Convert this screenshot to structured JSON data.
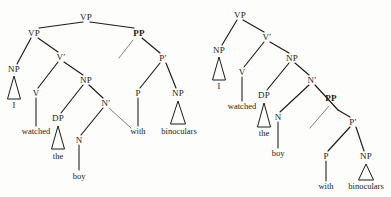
{
  "figure": {
    "kind": "syntax-tree-pair",
    "sentence_words": [
      "I",
      "watched",
      "the",
      "boy",
      "with",
      "binoculars"
    ],
    "ink_color": "#1d1a18",
    "trace_color": "#6e6a66",
    "background_color": "#fdfdfb"
  },
  "trees": [
    {
      "id": "vp-attachment",
      "name": "left-tree",
      "root_label": "VP",
      "highlight_label": "PP",
      "nodes": [
        {
          "id": "L-VP-top",
          "label": "VP",
          "x": 86,
          "y": 17,
          "bold": false,
          "type": "node"
        },
        {
          "id": "L-VP-low",
          "label": "VP",
          "x": 34,
          "y": 33,
          "bold": false,
          "type": "node"
        },
        {
          "id": "L-PP",
          "label": "PP",
          "x": 139,
          "y": 33,
          "bold": true,
          "type": "node"
        },
        {
          "id": "L-NP-subj",
          "label": "NP",
          "x": 14,
          "y": 69,
          "bold": false,
          "type": "node"
        },
        {
          "id": "L-Vbar",
          "label": "V′",
          "x": 61,
          "y": 57,
          "bold": false,
          "type": "node"
        },
        {
          "id": "L-V",
          "label": "V",
          "x": 36,
          "y": 93,
          "bold": false,
          "type": "node"
        },
        {
          "id": "L-NP-obj",
          "label": "NP",
          "x": 86,
          "y": 80,
          "bold": false,
          "type": "node"
        },
        {
          "id": "L-DP",
          "label": "DP",
          "x": 58,
          "y": 118,
          "bold": false,
          "type": "node"
        },
        {
          "id": "L-Nbar",
          "label": "N′",
          "x": 106,
          "y": 103,
          "bold": false,
          "type": "node"
        },
        {
          "id": "L-N",
          "label": "N",
          "x": 79,
          "y": 140,
          "bold": false,
          "type": "node"
        },
        {
          "id": "L-Pbar",
          "label": "P′",
          "x": 163,
          "y": 58,
          "bold": false,
          "type": "node"
        },
        {
          "id": "L-P",
          "label": "P",
          "x": 138,
          "y": 93,
          "bold": false,
          "type": "node"
        },
        {
          "id": "L-NP-pobj",
          "label": "NP",
          "x": 178,
          "y": 93,
          "bold": false,
          "type": "node"
        }
      ],
      "leaves": [
        {
          "id": "L-leaf-I",
          "label": "I",
          "x": 14,
          "y": 105
        },
        {
          "id": "L-leaf-wat",
          "label": "watched",
          "x": 36,
          "y": 131
        },
        {
          "id": "L-leaf-the",
          "label": "the",
          "x": 58,
          "y": 156
        },
        {
          "id": "L-leaf-boy",
          "label": "boy",
          "x": 79,
          "y": 176
        },
        {
          "id": "L-leaf-with",
          "label": "with",
          "x": 138,
          "y": 131
        },
        {
          "id": "L-leaf-bino",
          "label": "binoculars",
          "x": 179,
          "y": 131
        }
      ],
      "branches": [
        {
          "from": "L-VP-top",
          "to": "L-VP-low",
          "x1": 83,
          "y1": 22,
          "x2": 39,
          "y2": 28
        },
        {
          "from": "L-VP-top",
          "to": "L-PP",
          "x1": 90,
          "y1": 22,
          "x2": 134,
          "y2": 28
        },
        {
          "from": "L-VP-low",
          "to": "L-NP-subj",
          "x1": 31,
          "y1": 38,
          "x2": 17,
          "y2": 64
        },
        {
          "from": "L-VP-low",
          "to": "L-Vbar",
          "x1": 38,
          "y1": 38,
          "x2": 58,
          "y2": 52
        },
        {
          "from": "L-Vbar",
          "to": "L-V",
          "x1": 58,
          "y1": 62,
          "x2": 38,
          "y2": 88
        },
        {
          "from": "L-Vbar",
          "to": "L-NP-obj",
          "x1": 64,
          "y1": 62,
          "x2": 83,
          "y2": 75
        },
        {
          "from": "L-NP-obj",
          "to": "L-DP",
          "x1": 83,
          "y1": 85,
          "x2": 61,
          "y2": 113
        },
        {
          "from": "L-NP-obj",
          "to": "L-Nbar",
          "x1": 89,
          "y1": 85,
          "x2": 103,
          "y2": 98
        },
        {
          "from": "L-Nbar",
          "to": "L-N",
          "x1": 103,
          "y1": 108,
          "x2": 81,
          "y2": 135
        },
        {
          "from": "L-PP",
          "to": "L-Pbar",
          "x1": 142,
          "y1": 38,
          "x2": 160,
          "y2": 53
        },
        {
          "from": "L-Pbar",
          "to": "L-P",
          "x1": 160,
          "y1": 63,
          "x2": 140,
          "y2": 88
        },
        {
          "from": "L-Pbar",
          "to": "L-NP-pobj",
          "x1": 166,
          "y1": 63,
          "x2": 176,
          "y2": 88
        }
      ],
      "stems": [
        {
          "from": "L-V",
          "to": "L-leaf-wat",
          "x1": 36,
          "y1": 98,
          "x2": 36,
          "y2": 126
        },
        {
          "from": "L-N",
          "to": "L-leaf-boy",
          "x1": 79,
          "y1": 145,
          "x2": 79,
          "y2": 170
        },
        {
          "from": "L-P",
          "to": "L-leaf-with",
          "x1": 138,
          "y1": 98,
          "x2": 138,
          "y2": 126
        }
      ],
      "triangles": [
        {
          "for": "L-NP-subj",
          "apex_x": 14,
          "apex_y": 76,
          "base_y": 99,
          "half_width": 6.5
        },
        {
          "for": "L-DP",
          "apex_x": 58,
          "apex_y": 126,
          "base_y": 149,
          "half_width": 6.5
        },
        {
          "for": "L-NP-pobj",
          "apex_x": 178,
          "apex_y": 101,
          "base_y": 124,
          "half_width": 7.5
        }
      ],
      "movement_arcs": [
        {
          "label": "pp-trace",
          "x1": 133,
          "y1": 40,
          "x2": 119,
          "y2": 58
        },
        {
          "label": "nbar-trace",
          "x1": 109,
          "y1": 108,
          "x2": 131,
          "y2": 128
        }
      ]
    },
    {
      "id": "np-attachment",
      "name": "right-tree",
      "root_label": "VP",
      "highlight_label": "PP",
      "nodes": [
        {
          "id": "R-VP",
          "label": "VP",
          "x": 240,
          "y": 15,
          "bold": false,
          "type": "node"
        },
        {
          "id": "R-NP-subj",
          "label": "NP",
          "x": 219,
          "y": 50,
          "bold": false,
          "type": "node"
        },
        {
          "id": "R-Vbar",
          "label": "V′",
          "x": 267,
          "y": 37,
          "bold": false,
          "type": "node"
        },
        {
          "id": "R-V",
          "label": "V",
          "x": 242,
          "y": 72,
          "bold": false,
          "type": "node"
        },
        {
          "id": "R-NP-obj",
          "label": "NP",
          "x": 292,
          "y": 58,
          "bold": false,
          "type": "node"
        },
        {
          "id": "R-DP",
          "label": "DP",
          "x": 264,
          "y": 95,
          "bold": false,
          "type": "node"
        },
        {
          "id": "R-Nbar",
          "label": "N′",
          "x": 312,
          "y": 80,
          "bold": false,
          "type": "node"
        },
        {
          "id": "R-N",
          "label": "N",
          "x": 278,
          "y": 117,
          "bold": false,
          "type": "node"
        },
        {
          "id": "R-PP",
          "label": "PP",
          "x": 331,
          "y": 98,
          "bold": true,
          "type": "node"
        },
        {
          "id": "R-Pbar",
          "label": "P′",
          "x": 353,
          "y": 122,
          "bold": false,
          "type": "node"
        },
        {
          "id": "R-P",
          "label": "P",
          "x": 326,
          "y": 156,
          "bold": false,
          "type": "node"
        },
        {
          "id": "R-NP-pobj",
          "label": "NP",
          "x": 366,
          "y": 156,
          "bold": false,
          "type": "node"
        }
      ],
      "leaves": [
        {
          "id": "R-leaf-I",
          "label": "I",
          "x": 219,
          "y": 86
        },
        {
          "id": "R-leaf-wat",
          "label": "watched",
          "x": 242,
          "y": 106
        },
        {
          "id": "R-leaf-the",
          "label": "the",
          "x": 264,
          "y": 133
        },
        {
          "id": "R-leaf-boy",
          "label": "boy",
          "x": 278,
          "y": 153
        },
        {
          "id": "R-leaf-with",
          "label": "with",
          "x": 326,
          "y": 186
        },
        {
          "id": "R-leaf-bino",
          "label": "binoculars",
          "x": 366,
          "y": 186
        }
      ],
      "branches": [
        {
          "from": "R-VP",
          "to": "R-NP-subj",
          "x1": 237,
          "y1": 20,
          "x2": 222,
          "y2": 45
        },
        {
          "from": "R-VP",
          "to": "R-Vbar",
          "x1": 243,
          "y1": 20,
          "x2": 264,
          "y2": 32
        },
        {
          "from": "R-Vbar",
          "to": "R-V",
          "x1": 264,
          "y1": 42,
          "x2": 244,
          "y2": 67
        },
        {
          "from": "R-Vbar",
          "to": "R-NP-obj",
          "x1": 270,
          "y1": 42,
          "x2": 289,
          "y2": 53
        },
        {
          "from": "R-NP-obj",
          "to": "R-DP",
          "x1": 289,
          "y1": 63,
          "x2": 267,
          "y2": 90
        },
        {
          "from": "R-NP-obj",
          "to": "R-Nbar",
          "x1": 295,
          "y1": 63,
          "x2": 309,
          "y2": 75
        },
        {
          "from": "R-Nbar",
          "to": "R-N",
          "x1": 309,
          "y1": 85,
          "x2": 280,
          "y2": 112
        },
        {
          "from": "R-Nbar",
          "to": "R-PP",
          "x1": 315,
          "y1": 85,
          "x2": 338,
          "y2": 110
        },
        {
          "from": "R-PP",
          "to": "R-Pbar",
          "x1": 338,
          "y1": 110,
          "x2": 350,
          "y2": 117
        },
        {
          "from": "R-Pbar",
          "to": "R-P",
          "x1": 350,
          "y1": 127,
          "x2": 328,
          "y2": 151
        },
        {
          "from": "R-Pbar",
          "to": "R-NP-pobj",
          "x1": 356,
          "y1": 127,
          "x2": 364,
          "y2": 151
        }
      ],
      "stems": [
        {
          "from": "R-V",
          "to": "R-leaf-wat",
          "x1": 242,
          "y1": 77,
          "x2": 242,
          "y2": 101
        },
        {
          "from": "R-N",
          "to": "R-leaf-boy",
          "x1": 278,
          "y1": 122,
          "x2": 278,
          "y2": 148
        },
        {
          "from": "R-P",
          "to": "R-leaf-with",
          "x1": 326,
          "y1": 161,
          "x2": 326,
          "y2": 181
        }
      ],
      "triangles": [
        {
          "for": "R-NP-subj",
          "apex_x": 219,
          "apex_y": 57,
          "base_y": 80,
          "half_width": 6.5
        },
        {
          "for": "R-DP",
          "apex_x": 264,
          "apex_y": 103,
          "base_y": 127,
          "half_width": 6.5
        },
        {
          "for": "R-NP-pobj",
          "apex_x": 366,
          "apex_y": 164,
          "base_y": 180,
          "half_width": 7.5
        }
      ],
      "movement_arcs": [
        {
          "label": "pp-trace",
          "x1": 329,
          "y1": 106,
          "x2": 310,
          "y2": 128
        }
      ]
    }
  ]
}
